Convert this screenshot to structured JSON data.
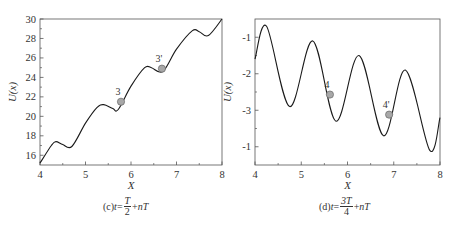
{
  "chart_data": [
    {
      "type": "line",
      "panel": "c",
      "title": "",
      "caption": {
        "prefix": "(c)",
        "var": "t",
        "eq": "=",
        "num": "T",
        "den": "2",
        "suffix_op": "+",
        "suffix": "nT"
      },
      "xlabel": "X",
      "ylabel": "U(x)",
      "xlim": [
        4,
        8
      ],
      "ylim": [
        15,
        30
      ],
      "xticks": [
        "4",
        "5",
        "6",
        "7",
        "8"
      ],
      "yticks": [
        "16",
        "18",
        "20",
        "22",
        "24",
        "26",
        "28",
        "30"
      ],
      "grid": false,
      "series": [
        {
          "name": "U(x)",
          "description": "rising potential: linear trend (~3.5 per unit X) plus sinusoid of period 1, amplitude ~1.2",
          "x": [
            4.0,
            4.25,
            4.35,
            4.5,
            4.7,
            5.0,
            5.25,
            5.4,
            5.6,
            5.72,
            6.0,
            6.3,
            6.45,
            6.7,
            7.0,
            7.35,
            7.5,
            7.7,
            8.0
          ],
          "y": [
            15.2,
            17.0,
            17.4,
            17.1,
            16.9,
            19.3,
            20.9,
            21.2,
            20.8,
            20.7,
            23.1,
            25.0,
            25.0,
            24.6,
            26.9,
            28.8,
            28.7,
            28.3,
            30.0
          ]
        }
      ],
      "annotations": [
        {
          "label": "3",
          "x": 5.78,
          "y": 21.5,
          "marker": "gray-circle"
        },
        {
          "label": "3'",
          "x": 6.68,
          "y": 24.9,
          "marker": "gray-circle"
        }
      ]
    },
    {
      "type": "line",
      "panel": "d",
      "title": "",
      "caption": {
        "prefix": "(d)",
        "var": "t",
        "eq": "=",
        "num": "3T",
        "den": "4",
        "suffix_op": "+",
        "suffix": "nT"
      },
      "xlabel": "X",
      "ylabel": "U(x)",
      "xlim": [
        4,
        8
      ],
      "ylim": [
        -4.5,
        -0.5
      ],
      "xticks": [
        "4",
        "5",
        "6",
        "7",
        "8"
      ],
      "yticks": [
        "-1",
        "-2",
        "-3",
        "-1"
      ],
      "ytick_values": [
        -1,
        -2,
        -3,
        -4
      ],
      "grid": false,
      "series": [
        {
          "name": "U(x)",
          "description": "descending sinusoid, period 1, amplitude ~1.1, trend ~-0.4 per unit X",
          "x": [
            4.0,
            4.25,
            4.75,
            5.25,
            5.75,
            6.25,
            6.78,
            7.25,
            7.78,
            8.0
          ],
          "y": [
            -1.6,
            -0.7,
            -2.9,
            -1.1,
            -3.3,
            -1.5,
            -3.7,
            -1.9,
            -4.1,
            -3.2
          ]
        }
      ],
      "annotations": [
        {
          "label": "4",
          "x": 5.62,
          "y": -2.57,
          "marker": "gray-circle"
        },
        {
          "label": "4'",
          "x": 6.9,
          "y": -3.12,
          "marker": "gray-circle"
        }
      ]
    }
  ],
  "style": {
    "line_color": "#1a1a1a",
    "axis_color": "#555555",
    "marker_fill": "#a8a8a8",
    "marker_stroke": "#666666"
  }
}
